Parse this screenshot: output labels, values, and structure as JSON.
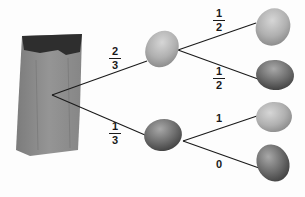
{
  "diagram": {
    "type": "probability-tree",
    "root": {
      "label": "bag",
      "icon": "paper-bag"
    },
    "level1": [
      {
        "item": "yellow-lemon",
        "probability": {
          "numerator": "2",
          "denominator": "3"
        }
      },
      {
        "item": "green-lime",
        "probability": {
          "numerator": "1",
          "denominator": "3"
        }
      }
    ],
    "level2": [
      {
        "parent": 0,
        "item": "yellow-lemon",
        "probability": {
          "numerator": "1",
          "denominator": "2"
        }
      },
      {
        "parent": 0,
        "item": "green-lime",
        "probability": {
          "numerator": "1",
          "denominator": "2"
        }
      },
      {
        "parent": 1,
        "item": "yellow-lemon",
        "probability": "1"
      },
      {
        "parent": 1,
        "item": "green-lime",
        "probability": "0"
      }
    ],
    "colors": {
      "line": "#1a1a1a",
      "bag": "#8a8a8a",
      "bag_opening": "#2e2e2e",
      "lemon_light": "#b5b5b5",
      "lime_dark": "#6a6a6a"
    }
  }
}
